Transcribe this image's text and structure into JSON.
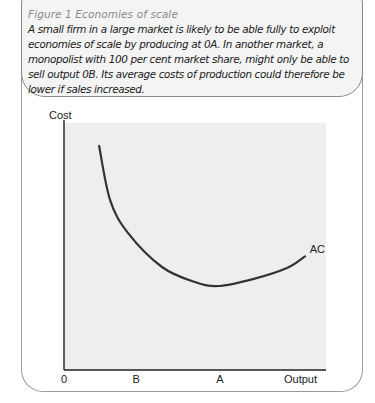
{
  "caption": {
    "title": "Figure 1  Economies of scale",
    "body": "A small firm in a large market is likely to be able fully to exploit economies of scale by producing at 0A.  In another market, a monopolist with 100 per cent market share, might only be able to sell output 0B.  Its average costs of production could therefore be lower if sales increased."
  },
  "colors": {
    "plot_background": "#eeeeee",
    "curve": "#333333",
    "axis": "#222222",
    "caption_title": "#8a8a8a"
  },
  "chart_data": {
    "type": "line",
    "title": "Economies of scale",
    "xlabel": "Output",
    "ylabel": "Cost",
    "origin_label": "0",
    "xlim": [
      0,
      10
    ],
    "ylim": [
      0,
      10
    ],
    "grid": false,
    "x_ticks": [
      {
        "label": "B",
        "value": 2.75
      },
      {
        "label": "A",
        "value": 5.95
      }
    ],
    "series": [
      {
        "name": "AC",
        "x": [
          1.34,
          1.76,
          2.44,
          3.74,
          5.0,
          5.9,
          7.21,
          8.51,
          9.2
        ],
        "y": [
          9.07,
          6.88,
          5.55,
          4.17,
          3.56,
          3.4,
          3.68,
          4.13,
          4.6
        ]
      }
    ],
    "annotations": [
      {
        "text": "AC",
        "x": 9.3,
        "y": 4.8
      }
    ]
  }
}
